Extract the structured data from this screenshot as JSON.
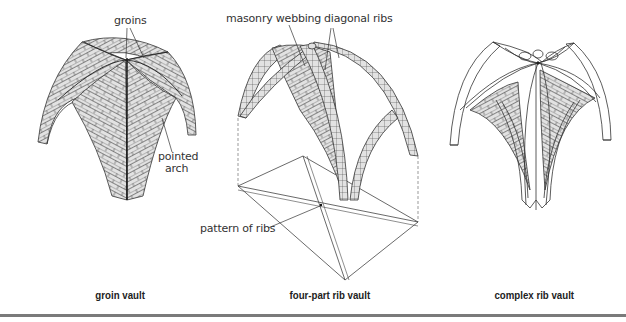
{
  "figure": {
    "panels": [
      {
        "id": "groin-vault",
        "caption": "groin vault",
        "labels": [
          {
            "text": "groins"
          },
          {
            "text": "pointed"
          },
          {
            "text": "arch"
          }
        ]
      },
      {
        "id": "four-part-rib-vault",
        "caption": "four-part rib vault",
        "labels": [
          {
            "text": "masonry webbing"
          },
          {
            "text": "diagonal ribs"
          },
          {
            "text": "pattern of ribs"
          }
        ]
      },
      {
        "id": "complex-rib-vault",
        "caption": "complex rib vault",
        "labels": []
      }
    ],
    "colors": {
      "brick_fill": "#e2e2e2",
      "line": "#333333",
      "label_text": "#333333",
      "rule": "#7a7a7a"
    }
  }
}
